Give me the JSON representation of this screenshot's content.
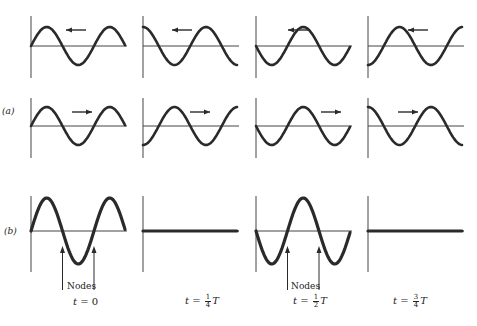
{
  "figure": {
    "part_labels": {
      "a": "(a)",
      "b": "(b)"
    },
    "nodes_label": "Nodes",
    "time_labels": [
      {
        "prefix": "t = ",
        "value": "0",
        "num": "",
        "den": "",
        "suffix": ""
      },
      {
        "prefix": "t = ",
        "value": "",
        "num": "1",
        "den": "4",
        "suffix": "T"
      },
      {
        "prefix": "t = ",
        "value": "",
        "num": "1",
        "den": "2",
        "suffix": "T"
      },
      {
        "prefix": "t = ",
        "value": "",
        "num": "3",
        "den": "4",
        "suffix": "T"
      }
    ],
    "rows": [
      {
        "name": "wave-moving-left",
        "direction": "left",
        "phases_deg": [
          0,
          90,
          180,
          270
        ]
      },
      {
        "name": "wave-moving-right",
        "direction": "right",
        "phases_deg": [
          0,
          270,
          180,
          90
        ]
      },
      {
        "name": "standing-wave",
        "direction": "none",
        "amplitudes": [
          1,
          0,
          -1,
          0
        ]
      }
    ],
    "colors": {
      "wave": "#2a2a2a",
      "axis": "#444444",
      "background": "#ffffff"
    }
  }
}
